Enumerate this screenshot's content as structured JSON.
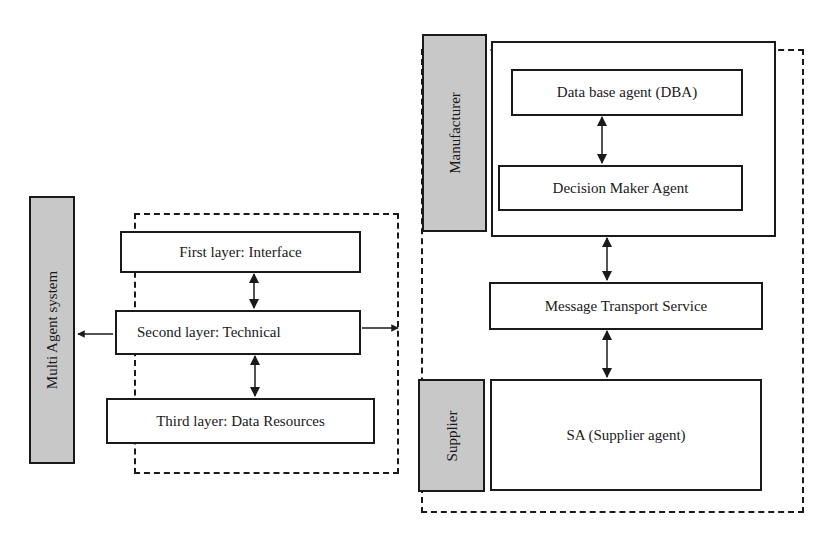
{
  "left": {
    "system_label": "Multi Agent system",
    "layers": [
      {
        "label": "First layer: Interface"
      },
      {
        "label": "Second layer: Technical"
      },
      {
        "label": "Third layer: Data Resources"
      }
    ]
  },
  "right": {
    "manufacturer": {
      "label": "Manufacturer",
      "agents": [
        {
          "label": "Data base agent (DBA)"
        },
        {
          "label": "Decision Maker Agent"
        }
      ]
    },
    "transport": {
      "label": "Message Transport Service"
    },
    "supplier": {
      "label": "Supplier",
      "agent": {
        "label": "SA (Supplier agent)"
      }
    }
  }
}
